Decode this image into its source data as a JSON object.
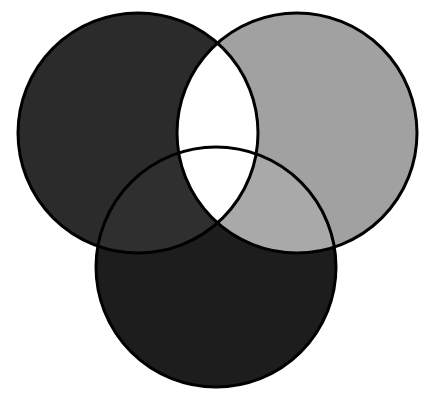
{
  "diagram": {
    "type": "venn",
    "sets": [
      {
        "id": "left",
        "cx": 138,
        "cy": 133,
        "r": 120,
        "fill": "#2b2b2b"
      },
      {
        "id": "right",
        "cx": 297,
        "cy": 133,
        "r": 120,
        "fill": "#a1a1a1"
      },
      {
        "id": "bottom",
        "cx": 216,
        "cy": 267,
        "r": 120,
        "fill": "#1d1d1d"
      }
    ],
    "regions": {
      "left_right": "#ffffff",
      "left_bottom": "#2f2f2f",
      "right_bottom": "#a9a9a9",
      "all_three": "#ffffff"
    },
    "stroke": "#000000",
    "stroke_width": 3,
    "background": "#ffffff"
  }
}
